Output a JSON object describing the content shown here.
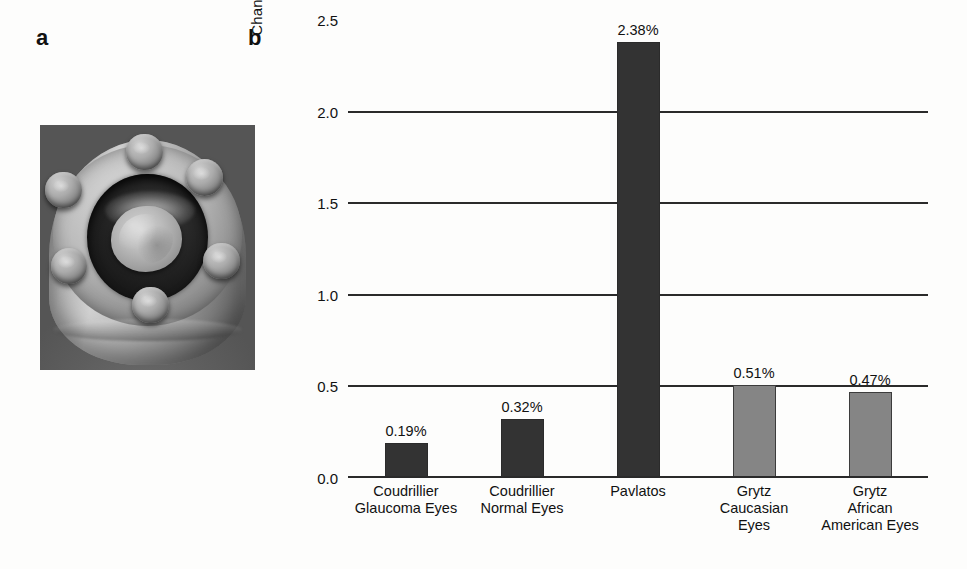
{
  "figure": {
    "panel_a": {
      "letter": "a",
      "image_description": "grayscale photograph of a bolted metal pressure-chamber fixture holding an ocular tissue specimen"
    },
    "panel_b": {
      "letter": "b"
    }
  },
  "chart_data": {
    "type": "bar",
    "title": "",
    "xlabel": "",
    "ylabel": "Changes in Strain (%) between 10 and 20 mmHg",
    "ylim": [
      0.0,
      2.5
    ],
    "yticks": [
      "0.0",
      "0.5",
      "1.0",
      "1.5",
      "2.0",
      "2.5"
    ],
    "ytick_values": [
      0.0,
      0.5,
      1.0,
      1.5,
      2.0,
      2.5
    ],
    "grid": true,
    "legend": "none",
    "categories": [
      "Coudrillier Glaucoma Eyes",
      "Coudrillier Normal Eyes",
      "Pavlatos",
      "Grytz Caucasian Eyes",
      "Grytz African American Eyes"
    ],
    "category_lines": [
      [
        "Coudrillier",
        "Glaucoma Eyes"
      ],
      [
        "Coudrillier",
        "Normal Eyes"
      ],
      [
        "Pavlatos"
      ],
      [
        "Grytz",
        "Caucasian",
        "Eyes"
      ],
      [
        "Grytz",
        "African",
        "American Eyes"
      ]
    ],
    "values": [
      0.19,
      0.32,
      2.38,
      0.51,
      0.47
    ],
    "value_labels": [
      "0.19%",
      "0.32%",
      "2.38%",
      "0.51%",
      "0.47%"
    ],
    "bar_colors": [
      "#333333",
      "#333333",
      "#333333",
      "#858585",
      "#858585"
    ]
  }
}
